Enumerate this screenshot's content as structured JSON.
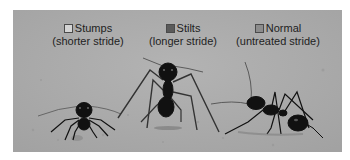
{
  "figure": {
    "background_color": "#a9a9a9"
  },
  "legend": {
    "items": [
      {
        "label": "Stumps",
        "sublabel": "(shorter stride)",
        "swatch_color": "#d4d4d4"
      },
      {
        "label": "Stilts",
        "sublabel": "(longer stride)",
        "swatch_color": "#5a5a5a"
      },
      {
        "label": "Normal",
        "sublabel": "(untreated stride)",
        "swatch_color": "#8c8c8c"
      }
    ]
  },
  "subjects": [
    {
      "name": "stumps-ant",
      "position": "left"
    },
    {
      "name": "stilts-ant",
      "position": "center"
    },
    {
      "name": "normal-ant",
      "position": "right"
    }
  ]
}
